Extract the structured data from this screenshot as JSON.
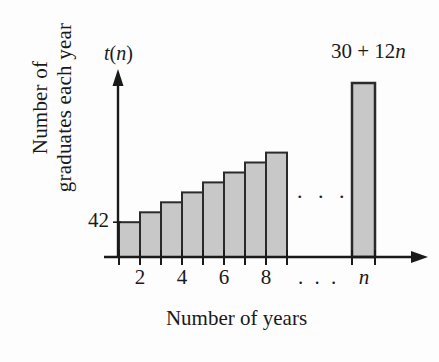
{
  "figure": {
    "background_color": "#fdfdfd",
    "ink_color": "#1a1a1a",
    "bar_fill_color": "#c8c8c8",
    "bar_stroke_color": "#2b2b2b"
  },
  "labels": {
    "y_axis_title": "Number of\ngraduates each year",
    "x_axis_title": "Number of years",
    "y_axis_symbol_func": "t",
    "y_axis_symbol_open": "(",
    "y_axis_symbol_arg": "n",
    "y_axis_symbol_close": ")",
    "y_tick_value": "42",
    "formula_constant": "30 + 12",
    "formula_variable": "n",
    "plot_ellipsis": ". . .",
    "axis_ellipsis": ". . ."
  },
  "chart_data": {
    "type": "bar",
    "title": "",
    "subtitle": "",
    "xlabel": "Number of years",
    "ylabel": "Number of graduates each year",
    "categories": [
      "1",
      "2",
      "3",
      "4",
      "5",
      "6",
      "7",
      "8",
      "n"
    ],
    "values": [
      42,
      54,
      66,
      78,
      90,
      102,
      114,
      126,
      210
    ],
    "series": [
      {
        "name": "t(n) = 30 + 12n",
        "values": [
          42,
          54,
          66,
          78,
          90,
          102,
          114,
          126,
          210
        ]
      }
    ],
    "annotations": [
      {
        "text": "30 + 12n",
        "target": "n-bar",
        "position": "top-right"
      },
      {
        "text": "42",
        "target": "first-bar-top",
        "position": "y-axis"
      },
      {
        "text": ". . .",
        "target": "gap-between-8-and-n",
        "position": "mid-plot"
      }
    ],
    "x_tick_labels": [
      "2",
      "4",
      "6",
      "8",
      ". . .",
      "n"
    ],
    "y_tick_labels": [
      "42"
    ],
    "xlim": [
      0,
      11
    ],
    "ylim": [
      0,
      240
    ],
    "grid": false,
    "legend": "none",
    "axis_arrows": true,
    "formula": "t(n) = 30 + 12n"
  }
}
